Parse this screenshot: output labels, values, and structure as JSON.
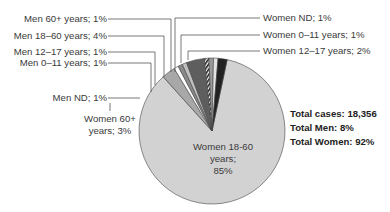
{
  "chart_data": {
    "type": "pie",
    "title": "",
    "slices": [
      {
        "label": "Women 18-60 years",
        "value": 85,
        "color": "#d2d2d2"
      },
      {
        "label": "Women 60+ years",
        "value": 3,
        "color": "#a8a8a8"
      },
      {
        "label": "Men ND",
        "value": 1,
        "color": "#ffffff"
      },
      {
        "label": "Men 0–11 years",
        "value": 1,
        "color": "#8a8a8a"
      },
      {
        "label": "Men 12–17 years",
        "value": 1,
        "color": "#c0c0c0"
      },
      {
        "label": "Men 18–60 years",
        "value": 4,
        "color": "#5e5e5e"
      },
      {
        "label": "Men 60+ years",
        "value": 1,
        "color": "striped"
      },
      {
        "label": "Women ND",
        "value": 1,
        "color": "#9a9a9a"
      },
      {
        "label": "Women 0–11 years",
        "value": 1,
        "color": "#e4e4e4"
      },
      {
        "label": "Women 12–17 years",
        "value": 2,
        "color": "#222222"
      }
    ],
    "annotations": {
      "total_cases": "Total cases: 18,356",
      "total_men": "Total Men: 8%",
      "total_women": "Total Women: 92%"
    },
    "legend": "none (leader-line labels)"
  },
  "labels": {
    "men_60": "Men 60+ years; 1%",
    "men_18_60": "Men 18–60 years; 4%",
    "men_12_17": "Men 12–17 years; 1%",
    "men_0_11": "Men 0–11 years; 1%",
    "men_nd": "Men ND; 1%",
    "women_60_l1": "Women 60+",
    "women_60_l2": "years; 3%",
    "women_nd": "Women ND; 1%",
    "women_0_11": "Women 0–11 years; 1%",
    "women_12_17": "Women 12–17 years; 2%",
    "women_18_60_l1": "Women 18-60",
    "women_18_60_l2": "years;",
    "women_18_60_l3": "85%"
  },
  "totals": {
    "cases": "Total cases: 18,356",
    "men": "Total Men: 8%",
    "women": "Total Women: 92%"
  }
}
